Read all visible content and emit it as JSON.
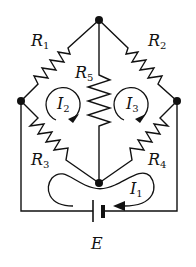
{
  "diagram": {
    "type": "circuit",
    "resistors": [
      {
        "id": "R1",
        "label": "R",
        "sub": "1",
        "between": [
          "left-node",
          "top-node"
        ]
      },
      {
        "id": "R2",
        "label": "R",
        "sub": "2",
        "between": [
          "top-node",
          "right-node"
        ]
      },
      {
        "id": "R3",
        "label": "R",
        "sub": "3",
        "between": [
          "left-node",
          "bottom-node"
        ]
      },
      {
        "id": "R4",
        "label": "R",
        "sub": "4",
        "between": [
          "right-node",
          "bottom-node"
        ]
      },
      {
        "id": "R5",
        "label": "R",
        "sub": "5",
        "between": [
          "top-node",
          "bottom-node"
        ]
      }
    ],
    "currents": [
      {
        "id": "I1",
        "label": "I",
        "sub": "1",
        "direction": "clockwise-around-battery-loop"
      },
      {
        "id": "I2",
        "label": "I",
        "sub": "2",
        "direction": "clockwise"
      },
      {
        "id": "I3",
        "label": "I",
        "sub": "3",
        "direction": "clockwise"
      }
    ],
    "source": {
      "id": "E",
      "label": "E"
    },
    "nodes": [
      "top-node",
      "left-node",
      "right-node",
      "bottom-node"
    ],
    "colors": {
      "ink": "#111111",
      "background": "#ffffff"
    }
  }
}
